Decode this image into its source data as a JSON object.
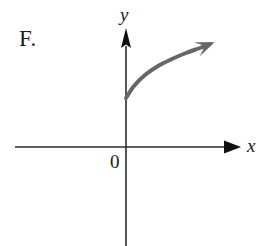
{
  "figure": {
    "label": "F.",
    "background_color": "#ffffff",
    "axis_color": "#2a2a2a",
    "curve_color": "#666666",
    "label_color": "#1a1a1a"
  },
  "axes": {
    "x_axis_label": "x",
    "y_axis_label": "y",
    "origin_label": "0",
    "x_axis_y_px": 147,
    "y_axis_x_px": 126,
    "x_axis_start_px": 15,
    "x_axis_arrow_tip_px": 241,
    "y_axis_arrow_tip_px": 28,
    "y_axis_end_px": 246
  },
  "chart_data": {
    "type": "line",
    "title": "",
    "xlabel": "x",
    "ylabel": "y",
    "grid": false,
    "legend": null,
    "annotations": [
      "F."
    ],
    "curve_style": {
      "stroke": "#666666",
      "stroke_width": 4,
      "arrow_end": true,
      "arrow_start": false
    },
    "series": [
      {
        "name": "curve",
        "points_px": [
          [
            126,
            98
          ],
          [
            134,
            86
          ],
          [
            145,
            75
          ],
          [
            158,
            66
          ],
          [
            172,
            59
          ],
          [
            186,
            53
          ],
          [
            200,
            48
          ],
          [
            210,
            44
          ]
        ]
      }
    ],
    "x": [
      0,
      0.1,
      0.25,
      0.42,
      0.6,
      0.78,
      0.96,
      1.1
    ],
    "values": [
      0.62,
      0.77,
      0.9,
      1.02,
      1.12,
      1.2,
      1.26,
      1.31
    ],
    "xlim": [
      -1.4,
      1.45
    ],
    "ylim": [
      -1.25,
      1.5
    ]
  }
}
